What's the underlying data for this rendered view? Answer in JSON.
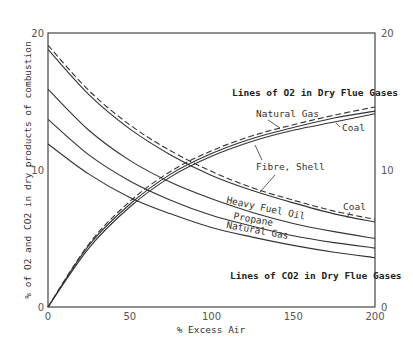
{
  "chart_data": {
    "type": "line",
    "title": "",
    "xlabel": "% Excess Air",
    "ylabel": "% of O2 and CO2 in dry products of combustion",
    "xlim": [
      0,
      200
    ],
    "ylim": [
      0,
      20
    ],
    "x_ticks": [
      "0",
      "50",
      "100",
      "150",
      "200"
    ],
    "y_ticks_left": [
      "0",
      "10",
      "20"
    ],
    "y_ticks_right": [
      "0",
      "10",
      "20"
    ],
    "grid": false,
    "annotations": {
      "rising_group_title": "Lines of O2 in Dry Flue Gases",
      "falling_group_title": "Lines of CO2 in Dry Flue Gases",
      "natural_gas_top": "Natural Gas",
      "coal_top": "Coal",
      "fibre_shell": "Fibre, Shell",
      "coal_mid": "Coal",
      "heavy_fuel_oil": "Heavy Fuel Oil",
      "propane": "Propane",
      "natural_gas_bottom": "Natural Gas"
    },
    "x": [
      0,
      25,
      50,
      75,
      100,
      125,
      150,
      175,
      200
    ],
    "series": [
      {
        "name": "Coal (falling, dashed)",
        "style": "dashed",
        "values": [
          19.1,
          15.8,
          13.3,
          11.4,
          9.9,
          8.7,
          7.8,
          7.0,
          6.4
        ]
      },
      {
        "name": "Fibre, Shell (falling)",
        "style": "solid",
        "values": [
          18.8,
          15.5,
          13.0,
          11.1,
          9.6,
          8.5,
          7.6,
          6.8,
          6.2
        ]
      },
      {
        "name": "Heavy Fuel Oil (falling)",
        "style": "solid",
        "values": [
          15.9,
          12.9,
          10.7,
          9.1,
          7.9,
          6.9,
          6.1,
          5.5,
          5.0
        ]
      },
      {
        "name": "Propane (falling)",
        "style": "solid",
        "values": [
          13.7,
          11.1,
          9.2,
          7.8,
          6.7,
          5.9,
          5.2,
          4.7,
          4.3
        ]
      },
      {
        "name": "Natural Gas (falling)",
        "style": "solid",
        "values": [
          11.9,
          9.7,
          8.0,
          6.8,
          5.8,
          5.1,
          4.5,
          4.0,
          3.6
        ]
      },
      {
        "name": "Natural Gas (rising, dashed)",
        "style": "dashed",
        "values": [
          0,
          4.6,
          7.7,
          9.9,
          11.4,
          12.5,
          13.3,
          14.0,
          14.6
        ]
      },
      {
        "name": "Coal (rising)",
        "style": "solid",
        "values": [
          0,
          4.3,
          7.3,
          9.5,
          11.0,
          12.1,
          12.9,
          13.5,
          14.1
        ]
      },
      {
        "name": "Fibre, Shell (rising)",
        "style": "solid",
        "values": [
          0,
          4.5,
          7.5,
          9.7,
          11.2,
          12.3,
          13.1,
          13.8,
          14.3
        ]
      }
    ]
  }
}
